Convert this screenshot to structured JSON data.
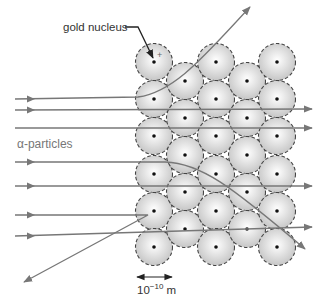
{
  "diagram": {
    "title_label": "gold nucleus",
    "particles_label": "α-particles",
    "scale_label": "10",
    "scale_exponent": "−10",
    "scale_unit": " m",
    "colors": {
      "trajectory": "#777777",
      "nucleus_dot": "#111111",
      "atom_fill_center": "#ffffff",
      "atom_fill_edge": "#c8c8c8",
      "atom_border": "#444444"
    },
    "atom_radius": 18.5,
    "atoms": [
      {
        "x": 154,
        "y": 62
      },
      {
        "x": 154,
        "y": 99
      },
      {
        "x": 154,
        "y": 136
      },
      {
        "x": 154,
        "y": 174
      },
      {
        "x": 154,
        "y": 211
      },
      {
        "x": 154,
        "y": 247
      },
      {
        "x": 185,
        "y": 81
      },
      {
        "x": 185,
        "y": 118
      },
      {
        "x": 185,
        "y": 155
      },
      {
        "x": 185,
        "y": 192
      },
      {
        "x": 185,
        "y": 229
      },
      {
        "x": 216,
        "y": 62
      },
      {
        "x": 216,
        "y": 99
      },
      {
        "x": 216,
        "y": 136
      },
      {
        "x": 216,
        "y": 174
      },
      {
        "x": 216,
        "y": 211
      },
      {
        "x": 216,
        "y": 247
      },
      {
        "x": 247,
        "y": 81
      },
      {
        "x": 247,
        "y": 118
      },
      {
        "x": 247,
        "y": 155
      },
      {
        "x": 247,
        "y": 192
      },
      {
        "x": 247,
        "y": 229
      },
      {
        "x": 277,
        "y": 62
      },
      {
        "x": 277,
        "y": 99
      },
      {
        "x": 277,
        "y": 136
      },
      {
        "x": 277,
        "y": 174
      },
      {
        "x": 277,
        "y": 211
      },
      {
        "x": 277,
        "y": 247
      }
    ],
    "trajectories": [
      {
        "name": "deflected-up",
        "d": "M15 99 L138 97 C175 92 205 55 250 7",
        "entry_arrow": {
          "x": 32,
          "y": 99
        },
        "end": {
          "x": 250,
          "y": 7,
          "angle": -47
        }
      },
      {
        "name": "straight-1",
        "d": "M15 110 L312 109",
        "entry_arrow": {
          "x": 32,
          "y": 110
        },
        "end": {
          "x": 312,
          "y": 109,
          "angle": 0
        }
      },
      {
        "name": "straight-2",
        "d": "M15 128 L312 128",
        "entry_arrow": null,
        "end": {
          "x": 312,
          "y": 128,
          "angle": 0
        }
      },
      {
        "name": "deflected-down",
        "d": "M15 162 L165 162 C200 163 230 185 305 249",
        "entry_arrow": {
          "x": 32,
          "y": 162
        },
        "end": {
          "x": 305,
          "y": 249,
          "angle": 40
        }
      },
      {
        "name": "straight-3",
        "d": "M15 186 L312 186",
        "entry_arrow": {
          "x": 32,
          "y": 186
        },
        "end": {
          "x": 312,
          "y": 186,
          "angle": 0
        }
      },
      {
        "name": "backscattered",
        "d": "M15 215 L148 215 L24 282",
        "entry_arrow": {
          "x": 32,
          "y": 215
        },
        "end": {
          "x": 24,
          "y": 282,
          "angle": 152
        }
      },
      {
        "name": "straight-4",
        "d": "M15 236 L312 227",
        "entry_arrow": {
          "x": 32,
          "y": 236
        },
        "end": {
          "x": 312,
          "y": 227,
          "angle": -2
        }
      }
    ],
    "pointer": {
      "line_start": {
        "x": 125,
        "y": 27
      },
      "line_mid": {
        "x": 138,
        "y": 27
      },
      "tip": {
        "x": 153,
        "y": 58
      }
    },
    "scale_bar": {
      "x1": 137,
      "x2": 172,
      "y": 277
    }
  }
}
